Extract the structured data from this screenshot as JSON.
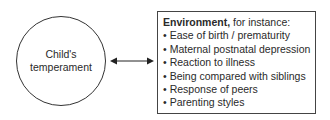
{
  "diagram": {
    "left_node": {
      "lines": [
        "Child's",
        "temperament"
      ]
    },
    "connector": {
      "type": "bidirectional-arrow"
    },
    "right_box": {
      "title_bold": "Environment,",
      "title_rest": " for instance:",
      "items": [
        "Ease of birth / prematurity",
        "Maternal postnatal depression",
        "Reaction to illness",
        "Being compared with siblings",
        "Response of peers",
        "Parenting styles"
      ]
    }
  }
}
